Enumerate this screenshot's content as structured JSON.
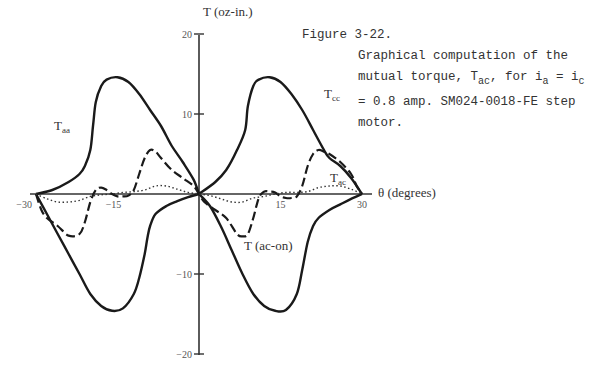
{
  "figure": {
    "number": "Figure 3-22.",
    "caption_line1": "Graphical computation of the",
    "caption_line2_pre": "mutual torque, T",
    "caption_line2_sub1": "ac",
    "caption_line2_mid": ", for i",
    "caption_line2_sub2": "a",
    "caption_line2_mid2": " = i",
    "caption_line2_sub3": "c",
    "caption_line3": "= 0.8 amp. SM024-0018-FE step",
    "caption_line4": "motor."
  },
  "chart_data": {
    "type": "line",
    "title": "Graphical computation of the mutual torque, Tac, for ia = ic = 0.8 amp. SM024-0018-FE step motor.",
    "xlabel": "θ (degrees)",
    "ylabel": "T (oz-in.)",
    "xlim": [
      -30,
      30
    ],
    "ylim": [
      -20,
      20
    ],
    "xticks": [
      -30,
      -15,
      15,
      30
    ],
    "xtick_labels": [
      "−30",
      "−15",
      "15",
      "30"
    ],
    "yticks": [
      20,
      10,
      -10,
      -20
    ],
    "ytick_labels": [
      "20",
      "10",
      "−10",
      "−20"
    ],
    "grid": false,
    "series": [
      {
        "name": "Taa",
        "label_main": "T",
        "label_sub": "aa",
        "style": "solid",
        "x": [
          -30,
          -27,
          -24,
          -22,
          -21,
          -20,
          -19.5,
          -19,
          -18,
          -17,
          -15,
          -13,
          -11,
          -9,
          -7,
          -5,
          -3,
          -1,
          0
        ],
        "y": [
          0,
          0.5,
          1.5,
          2.5,
          3.5,
          5.5,
          8.5,
          11.5,
          13.5,
          14.3,
          14.6,
          14.0,
          12.5,
          10.5,
          8.5,
          6.0,
          4.0,
          1.8,
          0
        ]
      },
      {
        "name": "Taa (negative lobe)",
        "style": "solid",
        "x": [
          -30,
          -28,
          -26,
          -24,
          -22,
          -20,
          -18,
          -16,
          -14,
          -12,
          -11,
          -10,
          -9.5,
          -9,
          -8,
          -6,
          -4,
          -2,
          0
        ],
        "y": [
          0,
          -2.5,
          -5.0,
          -7.5,
          -10.0,
          -12.5,
          -14.0,
          -14.6,
          -14.3,
          -12.5,
          -10.5,
          -7.5,
          -5.5,
          -4.0,
          -2.5,
          -1.5,
          -0.9,
          -0.4,
          0
        ]
      },
      {
        "name": "Tcc",
        "label_main": "T",
        "label_sub": "cc",
        "style": "solid",
        "x": [
          0,
          3,
          5,
          7,
          8.5,
          9,
          10,
          11,
          13,
          15,
          17,
          19,
          21,
          23,
          24,
          26,
          28,
          30
        ],
        "y": [
          0,
          1.5,
          3.0,
          5.5,
          8.0,
          11.0,
          13.5,
          14.3,
          14.6,
          14.0,
          12.5,
          10.5,
          8.0,
          5.5,
          4.5,
          3.5,
          2.0,
          0
        ]
      },
      {
        "name": "Tcc (negative lobe)",
        "style": "solid",
        "x": [
          0,
          2,
          4,
          6,
          8,
          10,
          12,
          14,
          16,
          18,
          19,
          20,
          21,
          22,
          24,
          26,
          28,
          30
        ],
        "y": [
          0,
          -1.5,
          -4.0,
          -7.0,
          -10.0,
          -12.5,
          -14.0,
          -14.6,
          -14.5,
          -12.5,
          -9.5,
          -6.0,
          -4.0,
          -3.0,
          -2.0,
          -1.3,
          -0.6,
          0
        ]
      },
      {
        "name": "T (ac-on)",
        "label_main": "T (ac-on)",
        "style": "dashed",
        "x": [
          -30,
          -29,
          -28,
          -26,
          -24,
          -22,
          -21,
          -20,
          -19,
          -18,
          -17,
          -16,
          -15,
          -14,
          -13,
          -12,
          -11,
          -10,
          -9,
          -8,
          -7,
          -5,
          -3,
          -1,
          0,
          1,
          3,
          5,
          7,
          8,
          9,
          10,
          11,
          12,
          13,
          14,
          15,
          16,
          17,
          18,
          19,
          20,
          21,
          22,
          23,
          24,
          26,
          28,
          29,
          30
        ],
        "y": [
          0,
          -2.0,
          -3.0,
          -4.0,
          -5.2,
          -5.0,
          -3.5,
          -1.0,
          0.5,
          0.8,
          0.5,
          0,
          -0.3,
          -0.3,
          -0.2,
          0.5,
          2.5,
          4.5,
          5.5,
          5.3,
          4.5,
          3.0,
          2.0,
          1.0,
          0,
          -1.0,
          -2.0,
          -3.0,
          -5.0,
          -5.3,
          -5.0,
          -3.0,
          -0.5,
          0.3,
          0.3,
          0.2,
          -0.3,
          -0.5,
          -0.5,
          -0.3,
          1.0,
          3.5,
          5.0,
          5.5,
          5.3,
          5.0,
          4.0,
          2.5,
          1.0,
          0
        ]
      },
      {
        "name": "Tac",
        "label_main": "T",
        "label_sub": "ac",
        "style": "dotted",
        "x": [
          -30,
          -28,
          -26,
          -24,
          -22,
          -20,
          -18,
          -16,
          -14,
          -12,
          -10,
          -8,
          -6,
          -4,
          -2,
          0,
          2,
          4,
          6,
          8,
          10,
          12,
          14,
          16,
          18,
          20,
          22,
          24,
          26,
          28,
          30
        ],
        "y": [
          0,
          -0.6,
          -1.0,
          -1.0,
          -0.8,
          -0.3,
          -0.1,
          0,
          0.2,
          0.3,
          0.5,
          1.0,
          1.0,
          0.6,
          0.2,
          0,
          -0.2,
          -0.6,
          -1.0,
          -1.0,
          -0.5,
          -0.3,
          0,
          0.2,
          0.2,
          0.3,
          0.8,
          1.0,
          1.0,
          0.6,
          0
        ]
      }
    ],
    "annotations": [
      {
        "text": "Taa",
        "theta": -27.5,
        "T": 8
      },
      {
        "text": "Tcc",
        "theta": 24,
        "T": 12.5
      },
      {
        "text": "Tac",
        "theta": 24.5,
        "T": 1.5
      },
      {
        "text": "T (ac-on)",
        "theta": 17,
        "T": -7.5
      }
    ]
  },
  "axis": {
    "ylabel": "T (oz-in.)",
    "xlabel": "θ (degrees)",
    "yticks": [
      {
        "label": "20",
        "value": 20
      },
      {
        "label": "10",
        "value": 10
      },
      {
        "label": "−10",
        "value": -10
      },
      {
        "label": "−20",
        "value": -20
      }
    ],
    "xticks": [
      {
        "label": "−30",
        "value": -30
      },
      {
        "label": "−15",
        "value": -15
      },
      {
        "label": "15",
        "value": 15
      },
      {
        "label": "30",
        "value": 30
      }
    ]
  },
  "labels": {
    "taa_main": "T",
    "taa_sub": "aa",
    "tcc_main": "T",
    "tcc_sub": "cc",
    "tac_main": "T",
    "tac_sub": "ac",
    "tacon": "T (ac-on)"
  }
}
